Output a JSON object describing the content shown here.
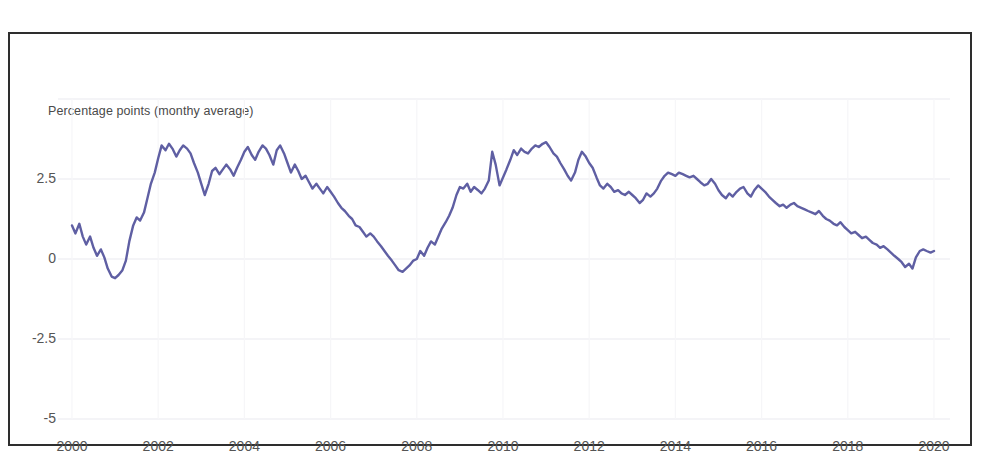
{
  "chart_data": {
    "type": "line",
    "title": "",
    "axis_note": "Percentage points (monthy average)",
    "xlabel": "",
    "ylabel": "Percentage points (monthy average)",
    "xlim": [
      2000,
      2020
    ],
    "ylim": [
      -5,
      5
    ],
    "grid": true,
    "legend": false,
    "series_color": "#5f5fa3",
    "x_tick_labels": [
      "2000",
      "2002",
      "2004",
      "2006",
      "2008",
      "2010",
      "2012",
      "2014",
      "2016",
      "2018",
      "2020"
    ],
    "x_tick_values": [
      2000,
      2002,
      2004,
      2006,
      2008,
      2010,
      2012,
      2014,
      2016,
      2018,
      2020
    ],
    "y_tick_labels": [
      "2.5",
      "0",
      "-2.5",
      "-5"
    ],
    "y_tick_values": [
      2.5,
      0,
      -2.5,
      -5
    ],
    "series": [
      {
        "name": "Percentage points (monthy average)",
        "x": [
          2000.0,
          2000.08,
          2000.17,
          2000.25,
          2000.33,
          2000.42,
          2000.5,
          2000.58,
          2000.67,
          2000.75,
          2000.83,
          2000.92,
          2001.0,
          2001.08,
          2001.17,
          2001.25,
          2001.33,
          2001.42,
          2001.5,
          2001.58,
          2001.67,
          2001.75,
          2001.83,
          2001.92,
          2002.0,
          2002.08,
          2002.17,
          2002.25,
          2002.33,
          2002.42,
          2002.5,
          2002.58,
          2002.67,
          2002.75,
          2002.83,
          2002.92,
          2003.0,
          2003.08,
          2003.17,
          2003.25,
          2003.33,
          2003.42,
          2003.5,
          2003.58,
          2003.67,
          2003.75,
          2003.83,
          2003.92,
          2004.0,
          2004.08,
          2004.17,
          2004.25,
          2004.33,
          2004.42,
          2004.5,
          2004.58,
          2004.67,
          2004.75,
          2004.83,
          2004.92,
          2005.0,
          2005.08,
          2005.17,
          2005.25,
          2005.33,
          2005.42,
          2005.5,
          2005.58,
          2005.67,
          2005.75,
          2005.83,
          2005.92,
          2006.0,
          2006.08,
          2006.17,
          2006.25,
          2006.33,
          2006.42,
          2006.5,
          2006.58,
          2006.67,
          2006.75,
          2006.83,
          2006.92,
          2007.0,
          2007.08,
          2007.17,
          2007.25,
          2007.33,
          2007.42,
          2007.5,
          2007.58,
          2007.67,
          2007.75,
          2007.83,
          2007.92,
          2008.0,
          2008.08,
          2008.17,
          2008.25,
          2008.33,
          2008.42,
          2008.5,
          2008.58,
          2008.67,
          2008.75,
          2008.83,
          2008.92,
          2009.0,
          2009.08,
          2009.17,
          2009.25,
          2009.33,
          2009.42,
          2009.5,
          2009.58,
          2009.67,
          2009.75,
          2009.83,
          2009.92,
          2010.0,
          2010.08,
          2010.17,
          2010.25,
          2010.33,
          2010.42,
          2010.5,
          2010.58,
          2010.67,
          2010.75,
          2010.83,
          2010.92,
          2011.0,
          2011.08,
          2011.17,
          2011.25,
          2011.33,
          2011.42,
          2011.5,
          2011.58,
          2011.67,
          2011.75,
          2011.83,
          2011.92,
          2012.0,
          2012.08,
          2012.17,
          2012.25,
          2012.33,
          2012.42,
          2012.5,
          2012.58,
          2012.67,
          2012.75,
          2012.83,
          2012.92,
          2013.0,
          2013.08,
          2013.17,
          2013.25,
          2013.33,
          2013.42,
          2013.5,
          2013.58,
          2013.67,
          2013.75,
          2013.83,
          2013.92,
          2014.0,
          2014.08,
          2014.17,
          2014.25,
          2014.33,
          2014.42,
          2014.5,
          2014.58,
          2014.67,
          2014.75,
          2014.83,
          2014.92,
          2015.0,
          2015.08,
          2015.17,
          2015.25,
          2015.33,
          2015.42,
          2015.5,
          2015.58,
          2015.67,
          2015.75,
          2015.83,
          2015.92,
          2016.0,
          2016.08,
          2016.17,
          2016.25,
          2016.33,
          2016.42,
          2016.5,
          2016.58,
          2016.67,
          2016.75,
          2016.83,
          2016.92,
          2017.0,
          2017.08,
          2017.17,
          2017.25,
          2017.33,
          2017.42,
          2017.5,
          2017.58,
          2017.67,
          2017.75,
          2017.83,
          2017.92,
          2018.0,
          2018.08,
          2018.17,
          2018.25,
          2018.33,
          2018.42,
          2018.5,
          2018.58,
          2018.67,
          2018.75,
          2018.83,
          2018.92,
          2019.0,
          2019.08,
          2019.17,
          2019.25,
          2019.33,
          2019.42,
          2019.5,
          2019.58,
          2019.67,
          2019.75,
          2019.83,
          2019.92,
          2020.0
        ],
        "values": [
          1.05,
          0.8,
          1.1,
          0.7,
          0.45,
          0.7,
          0.35,
          0.1,
          0.3,
          0.05,
          -0.3,
          -0.55,
          -0.6,
          -0.5,
          -0.35,
          -0.05,
          0.55,
          1.05,
          1.3,
          1.2,
          1.45,
          1.9,
          2.35,
          2.7,
          3.15,
          3.55,
          3.4,
          3.6,
          3.45,
          3.2,
          3.4,
          3.55,
          3.45,
          3.3,
          3.0,
          2.7,
          2.35,
          2.0,
          2.35,
          2.75,
          2.85,
          2.65,
          2.8,
          2.95,
          2.8,
          2.6,
          2.85,
          3.1,
          3.35,
          3.5,
          3.25,
          3.1,
          3.35,
          3.55,
          3.45,
          3.25,
          2.95,
          3.4,
          3.55,
          3.3,
          3.0,
          2.7,
          2.95,
          2.75,
          2.5,
          2.6,
          2.4,
          2.2,
          2.35,
          2.2,
          2.05,
          2.25,
          2.1,
          1.95,
          1.75,
          1.6,
          1.5,
          1.35,
          1.25,
          1.05,
          1.0,
          0.85,
          0.7,
          0.8,
          0.7,
          0.55,
          0.4,
          0.25,
          0.1,
          -0.05,
          -0.2,
          -0.35,
          -0.4,
          -0.3,
          -0.2,
          -0.05,
          0.0,
          0.25,
          0.1,
          0.35,
          0.55,
          0.45,
          0.7,
          0.95,
          1.15,
          1.35,
          1.6,
          2.0,
          2.25,
          2.2,
          2.35,
          2.1,
          2.25,
          2.15,
          2.05,
          2.2,
          2.45,
          3.35,
          2.95,
          2.3,
          2.55,
          2.8,
          3.1,
          3.4,
          3.25,
          3.45,
          3.35,
          3.3,
          3.45,
          3.55,
          3.5,
          3.6,
          3.65,
          3.5,
          3.3,
          3.2,
          3.0,
          2.8,
          2.6,
          2.45,
          2.7,
          3.1,
          3.35,
          3.2,
          3.0,
          2.85,
          2.55,
          2.3,
          2.2,
          2.35,
          2.25,
          2.1,
          2.15,
          2.05,
          2.0,
          2.1,
          2.0,
          1.9,
          1.75,
          1.85,
          2.05,
          1.95,
          2.05,
          2.2,
          2.45,
          2.6,
          2.7,
          2.65,
          2.6,
          2.7,
          2.65,
          2.6,
          2.55,
          2.6,
          2.5,
          2.4,
          2.3,
          2.35,
          2.5,
          2.35,
          2.15,
          2.0,
          1.9,
          2.05,
          1.95,
          2.1,
          2.2,
          2.25,
          2.05,
          1.95,
          2.15,
          2.3,
          2.2,
          2.1,
          1.95,
          1.85,
          1.75,
          1.65,
          1.7,
          1.6,
          1.7,
          1.75,
          1.65,
          1.6,
          1.55,
          1.5,
          1.45,
          1.4,
          1.5,
          1.35,
          1.25,
          1.2,
          1.1,
          1.05,
          1.15,
          1.0,
          0.9,
          0.8,
          0.85,
          0.75,
          0.65,
          0.7,
          0.6,
          0.5,
          0.45,
          0.35,
          0.4,
          0.3,
          0.2,
          0.1,
          0.0,
          -0.1,
          -0.25,
          -0.15,
          -0.3,
          0.05,
          0.25,
          0.3,
          0.25,
          0.2,
          0.25
        ]
      }
    ]
  },
  "labels": {
    "axis_note": "Percentage points (monthy average)",
    "y_ticks": [
      "2.5",
      "0",
      "-2.5",
      "-5"
    ],
    "x_ticks": [
      "2000",
      "2002",
      "2004",
      "2006",
      "2008",
      "2010",
      "2012",
      "2014",
      "2016",
      "2018",
      "2020"
    ]
  }
}
